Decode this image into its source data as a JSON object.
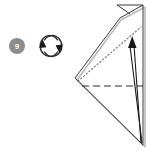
{
  "diagram": {
    "step_badge": {
      "label": "9",
      "fill_color": "#8c8c8c",
      "text_color": "#ffffff",
      "center_x": 17,
      "center_y": 46,
      "radius": 8
    },
    "rotate_symbol": {
      "name": "turn-over-symbol",
      "center_x": 51,
      "center_y": 46,
      "radius_x": 9,
      "radius_y": 10,
      "stroke_color": "#2b2b2b",
      "arrowhead_left": "up",
      "arrowhead_right": "down"
    },
    "colors": {
      "solid_edge": "#3a3a3a",
      "shadow_edge": "#b5b5b5",
      "dashed_fold": "#2b2b2b",
      "dotted_hidden": "#6b6b6b",
      "arrow": "#1a1a1a",
      "background": "#ffffff"
    },
    "model": {
      "description": "Folded kite/triangle form pointing left with small reverse-folded flap at top and a fold-arrow sweeping up the right side",
      "outline_points": "120,18 143,5 143,145 75,78",
      "vertices": {
        "left_point": [
          75,
          78
        ],
        "top_flap_tip": [
          120,
          18
        ],
        "top_right": [
          143,
          5
        ],
        "bottom_right": [
          143,
          145
        ]
      }
    },
    "fold_lines": {
      "valley_dashed": {
        "type": "valley",
        "style": "dashed",
        "from": [
          83,
          86
        ],
        "to": [
          143,
          86
        ]
      },
      "hidden_dotted": {
        "type": "hidden-edge",
        "style": "dotted",
        "from": [
          78,
          81
        ],
        "to": [
          141,
          27
        ]
      }
    },
    "arrow": {
      "name": "fold-direction-arrow",
      "direction": "up",
      "tail": [
        141,
        142
      ],
      "head": [
        133,
        38
      ],
      "stroke_color": "#1a1a1a"
    }
  }
}
